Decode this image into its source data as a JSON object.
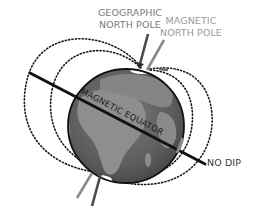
{
  "diagram": {
    "labels": {
      "geographic_north_pole_line1": "GEOGRAPHIC",
      "geographic_north_pole_line2": "NORTH POLE",
      "magnetic_north_pole_line1": "MAGNETIC",
      "magnetic_north_pole_line2": "NORTH POLE",
      "magnetic_equator": "MAGNETIC EQUATOR",
      "no_dip": "NO DIP"
    },
    "colors": {
      "globe_dark": "#5a5a5a",
      "globe_land": "#8c8c8c",
      "equator_line": "#111111",
      "geographic_axis": "#4a4a4a",
      "magnetic_axis": "#8a8a8a",
      "field_lines": "#1a1a1a",
      "label_geographic": "#7a7a7a",
      "label_magnetic": "#9a9a9a"
    },
    "elements": [
      "globe",
      "magnetic-equator-line",
      "geographic-axis-north",
      "magnetic-axis-north",
      "geographic-axis-south",
      "magnetic-axis-south",
      "magnetic-field-lines",
      "no-dip-marker"
    ]
  }
}
